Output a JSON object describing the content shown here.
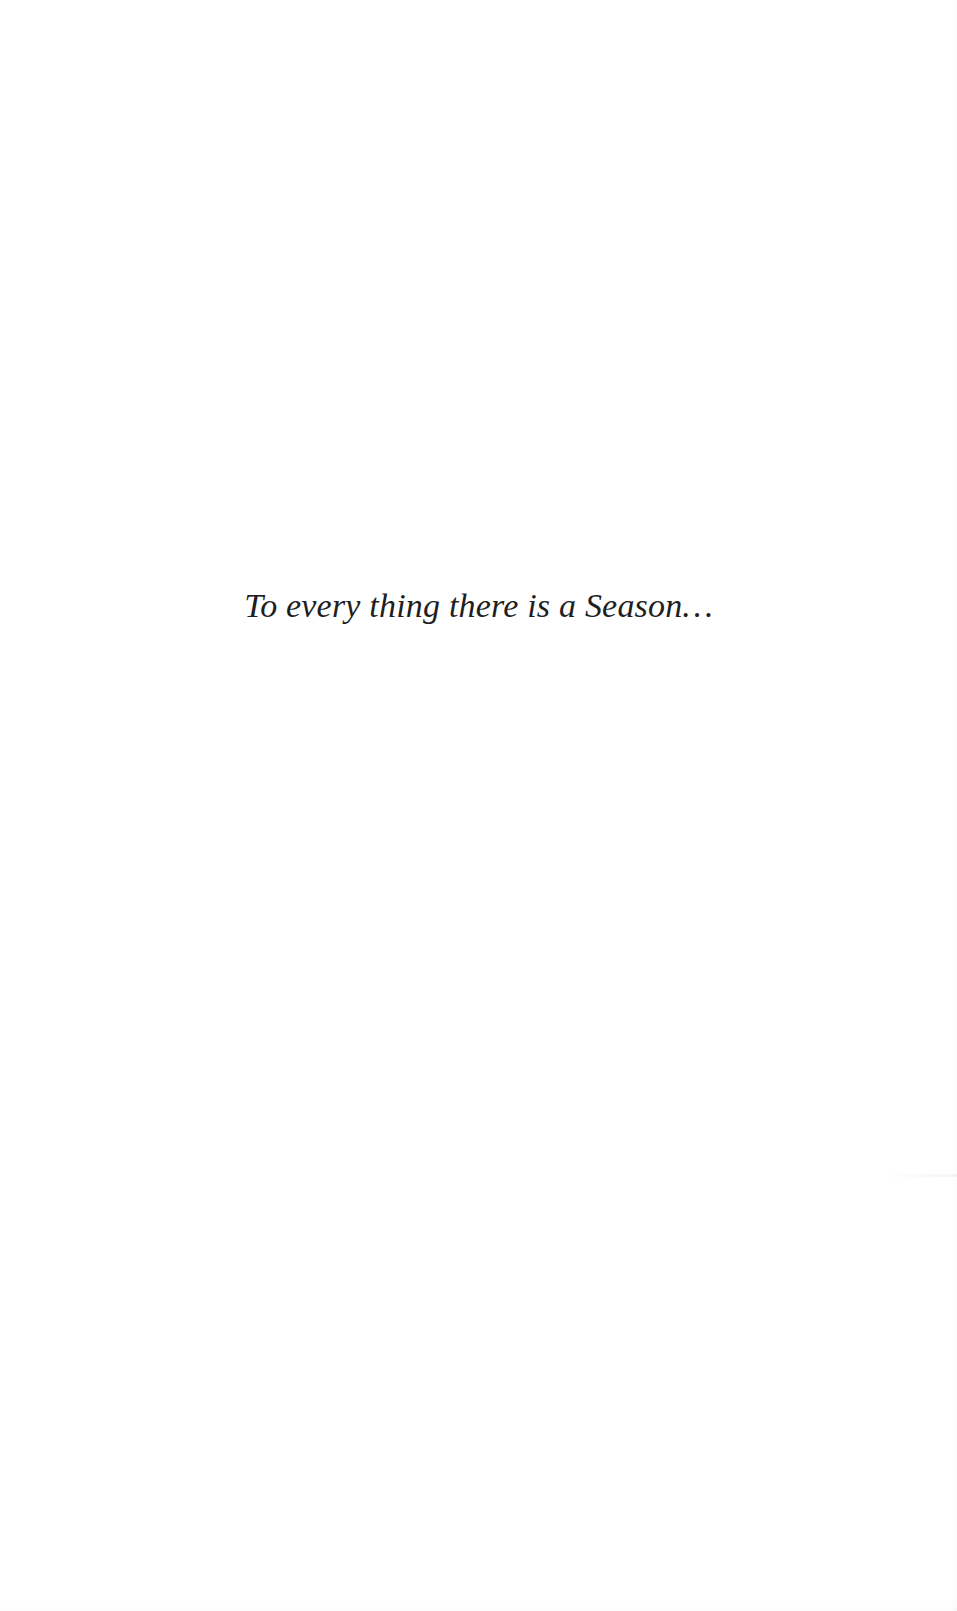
{
  "page": {
    "type": "epigraph",
    "epigraph_text": "To every thing there is a Season…"
  },
  "colors": {
    "background": "#ffffff",
    "text": "#1f1f1f"
  }
}
